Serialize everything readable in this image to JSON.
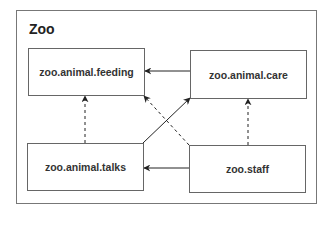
{
  "diagram": {
    "container_label": "Zoo",
    "nodes": [
      {
        "id": "feeding",
        "label": "zoo.animal.feeding"
      },
      {
        "id": "care",
        "label": "zoo.animal.care"
      },
      {
        "id": "talks",
        "label": "zoo.animal.talks"
      },
      {
        "id": "staff",
        "label": "zoo.staff"
      }
    ],
    "edges": [
      {
        "from": "zoo.animal.care",
        "to": "zoo.animal.feeding",
        "style": "solid"
      },
      {
        "from": "zoo.staff",
        "to": "zoo.animal.talks",
        "style": "solid"
      },
      {
        "from": "zoo.animal.talks",
        "to": "zoo.animal.care",
        "style": "solid"
      },
      {
        "from": "zoo.staff",
        "to": "zoo.animal.feeding",
        "style": "dashed"
      },
      {
        "from": "zoo.animal.talks",
        "to": "zoo.animal.feeding",
        "style": "dashed"
      },
      {
        "from": "zoo.staff",
        "to": "zoo.animal.care",
        "style": "dashed"
      }
    ],
    "colors": {
      "line": "#222222",
      "border": "#666666"
    }
  }
}
